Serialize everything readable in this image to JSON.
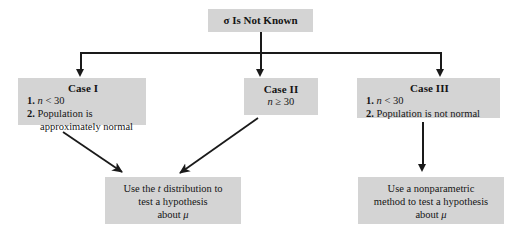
{
  "diagram": {
    "type": "flowchart",
    "root": {
      "label": "σ Is Not Known"
    },
    "cases": [
      {
        "id": "case-1",
        "title": "Case I",
        "lines": [
          {
            "num": "1.",
            "text": "n < 30",
            "italic_var": "n"
          },
          {
            "num": "2.",
            "text": "Population is"
          },
          {
            "num": "",
            "text": "approximately normal"
          }
        ]
      },
      {
        "id": "case-2",
        "title": "Case II",
        "lines": [
          {
            "num": "",
            "text": "n ≥ 30",
            "italic_var": "n"
          }
        ]
      },
      {
        "id": "case-3",
        "title": "Case III",
        "lines": [
          {
            "num": "1.",
            "text": "n < 30",
            "italic_var": "n"
          },
          {
            "num": "2.",
            "text": "Population is not normal"
          }
        ]
      }
    ],
    "conclusions": [
      {
        "id": "conclusion-left",
        "lines": [
          "Use the t distribution to",
          "test a hypothesis",
          "about μ"
        ]
      },
      {
        "id": "conclusion-right",
        "lines": [
          "Use a nonparametric",
          "method to test a hypothesis",
          "about μ"
        ]
      }
    ],
    "connectors": [
      {
        "name": "root-to-branch-bar",
        "kind": "vertical"
      },
      {
        "name": "branch-bar",
        "kind": "horizontal"
      },
      {
        "name": "branch-to-case-1",
        "kind": "vertical-arrow"
      },
      {
        "name": "branch-to-case-2",
        "kind": "vertical-arrow"
      },
      {
        "name": "branch-to-case-3",
        "kind": "vertical-arrow"
      },
      {
        "name": "case-1-to-conclusion-left",
        "kind": "diagonal-arrow"
      },
      {
        "name": "case-2-to-conclusion-left",
        "kind": "diagonal-arrow"
      },
      {
        "name": "case-3-to-conclusion-right",
        "kind": "vertical-arrow"
      }
    ],
    "colors": {
      "box_fill": "#d4d4d4",
      "line": "#1a1a1a",
      "background": "#ffffff",
      "text": "#141414"
    }
  }
}
